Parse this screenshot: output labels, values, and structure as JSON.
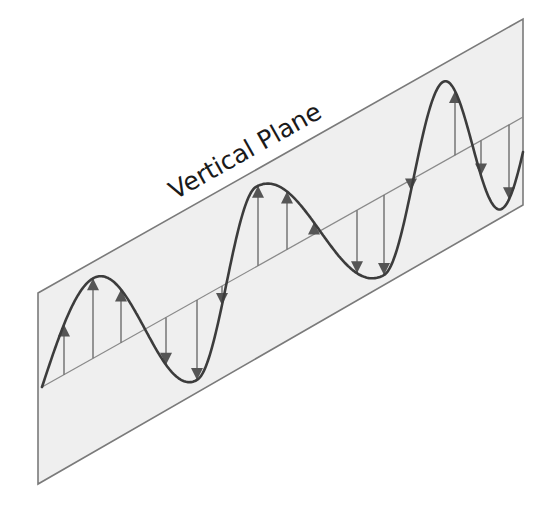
{
  "diagram": {
    "title": "Vertical Plane",
    "colors": {
      "plane_fill": "#efefef",
      "plane_stroke": "#7a7a7a",
      "wave": "#3c3c3c",
      "arrows": "#555555",
      "text": "#1a1a1a"
    },
    "plane_corners": [
      [
        38,
        293
      ],
      [
        523,
        19
      ],
      [
        523,
        205
      ],
      [
        38,
        484
      ]
    ],
    "axis": {
      "start": [
        42,
        387
      ],
      "end": [
        523,
        117
      ]
    },
    "wave": {
      "amplitude_px": 80,
      "x_start": 42,
      "x_end": 523,
      "peaks_x": [
        93,
        256,
        443
      ],
      "troughs_x": [
        197,
        384
      ]
    },
    "arrows": [
      {
        "x": 64,
        "dir": "up"
      },
      {
        "x": 93,
        "dir": "up"
      },
      {
        "x": 121,
        "dir": "up"
      },
      {
        "x": 166,
        "dir": "down"
      },
      {
        "x": 197,
        "dir": "down"
      },
      {
        "x": 222,
        "dir": "down"
      },
      {
        "x": 258,
        "dir": "up"
      },
      {
        "x": 287,
        "dir": "up"
      },
      {
        "x": 314,
        "dir": "up"
      },
      {
        "x": 357,
        "dir": "down"
      },
      {
        "x": 384,
        "dir": "down"
      },
      {
        "x": 411,
        "dir": "down"
      },
      {
        "x": 455,
        "dir": "up"
      },
      {
        "x": 481,
        "dir": "up"
      },
      {
        "x": 509,
        "dir": "up"
      }
    ],
    "label_position": {
      "x": 175,
      "y": 200,
      "rotation_deg": -29.3
    }
  }
}
